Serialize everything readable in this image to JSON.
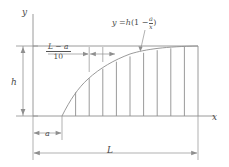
{
  "figure": {
    "type": "math-diagram",
    "axes": {
      "y_label": "y",
      "x_label": "x"
    },
    "curve": {
      "equation_display": "y = h(1 − a/x)",
      "equation_lhs": "y =",
      "equation_coefficient": "h",
      "equation_open_paren": "(1 −",
      "equation_numerator": "a",
      "equation_denominator": "x",
      "equation_close_paren": ")"
    },
    "dimensions": {
      "height_label": "h",
      "offset_label": "a",
      "total_length_label": "L",
      "strip_width_numerator": "L − a",
      "strip_width_denominator": "10"
    },
    "strip_count": 10,
    "colors": {
      "line": "#8a8a8a",
      "curve": "#8a8a8a",
      "text": "#4a4a4a",
      "background": "#ffffff"
    }
  }
}
